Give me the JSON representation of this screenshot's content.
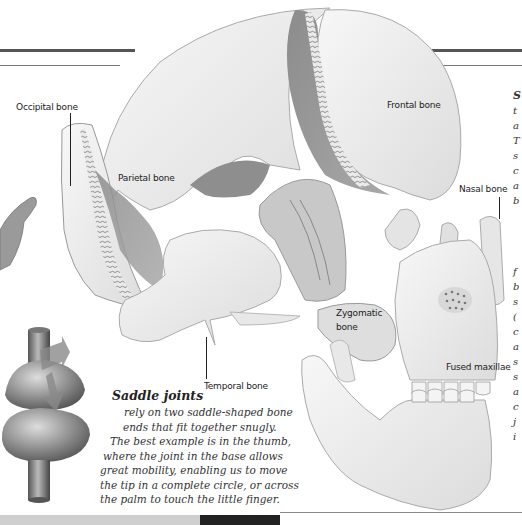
{
  "labels": {
    "occipital": "Occipital bone",
    "parietal": "Parietal bone",
    "frontal": "Frontal bone",
    "nasal": "Nasal bone",
    "zygomatic_line1": "Zygomatic",
    "zygomatic_line2": "bone",
    "temporal": "Temporal bone",
    "maxillae": "Fused maxillae"
  },
  "caption": {
    "title": "Saddle joints",
    "lines": [
      "rely on two saddle-shaped bone",
      "ends that fit together snugly.",
      "The best example is in the thumb,",
      "where the joint in the base allows",
      "great mobility, enabling us to move",
      "the tip in a complete circle, or across",
      "the palm to touch the little finger."
    ]
  },
  "cropped_side_text": {
    "upper": [
      "S",
      "t",
      "a",
      "T",
      "s",
      "c",
      "a",
      "b"
    ],
    "lower": [
      "f",
      "b",
      "s",
      "(",
      "c",
      "",
      "a",
      "s",
      "s",
      "a",
      "c",
      "j",
      "i",
      "s",
      "e"
    ]
  },
  "colors": {
    "rule": "#555555",
    "bone_light": "#f2f2f2",
    "bone_shade": "#9a9a9a",
    "bone_dark": "#7a7a7a",
    "text": "#222222"
  }
}
